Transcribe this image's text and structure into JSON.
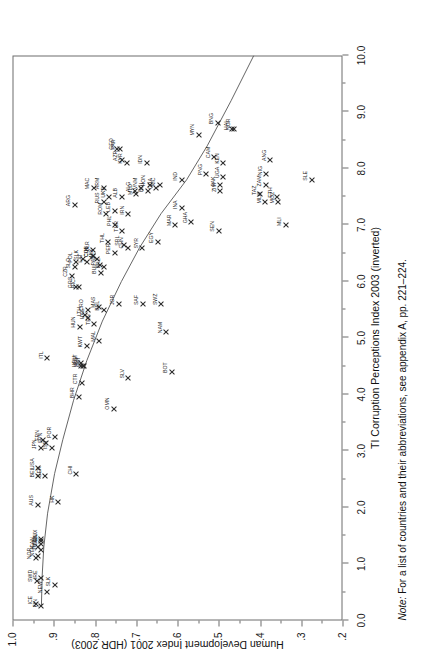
{
  "figure": {
    "note_prefix": "Note:",
    "note_text": " For a list of countries and their abbreviations, see appendix A, pp. 221–224."
  },
  "chart_data": {
    "type": "scatter",
    "title": "",
    "xlabel": "TI Corruption Perceptions Index 2003 (inverted)",
    "ylabel": "Human Development Index 2001 (HDR 2003)",
    "xlim": [
      0.0,
      10.0
    ],
    "ylim": [
      0.2,
      1.0
    ],
    "y_inverted": true,
    "grid": false,
    "legend": null,
    "xticks": [
      "0.0",
      "1.0",
      "2.0",
      "3.0",
      "4.0",
      "5.0",
      "6.0",
      "7.0",
      "8.0",
      "9.0",
      "10.0"
    ],
    "xtick_values": [
      0.0,
      1.0,
      2.0,
      3.0,
      4.0,
      5.0,
      6.0,
      7.0,
      8.0,
      9.0,
      10.0
    ],
    "yticks": [
      "1.0",
      ".9",
      ".8",
      ".7",
      ".6",
      ".5",
      ".4",
      ".3",
      ".2"
    ],
    "ytick_values": [
      1.0,
      0.9,
      0.8,
      0.7,
      0.6,
      0.5,
      0.4,
      0.3,
      0.2
    ],
    "marker": "x",
    "fit_line": {
      "present": true,
      "style": "solid",
      "points": [
        [
          0.25,
          0.93
        ],
        [
          0.8,
          0.928
        ],
        [
          1.3,
          0.924
        ],
        [
          1.9,
          0.915
        ],
        [
          2.6,
          0.898
        ],
        [
          3.2,
          0.878
        ],
        [
          3.9,
          0.852
        ],
        [
          4.6,
          0.82
        ],
        [
          5.3,
          0.782
        ],
        [
          6.0,
          0.736
        ],
        [
          6.6,
          0.692
        ],
        [
          7.2,
          0.64
        ],
        [
          7.8,
          0.578
        ],
        [
          8.4,
          0.528
        ],
        [
          9.2,
          0.47
        ],
        [
          10.0,
          0.415
        ]
      ]
    },
    "points": [
      {
        "label": "ICE",
        "x": 0.3,
        "y": 0.942
      },
      {
        "label": "FIN",
        "x": 0.25,
        "y": 0.93
      },
      {
        "label": "SWD",
        "x": 0.7,
        "y": 0.941
      },
      {
        "label": "NEW",
        "x": 0.5,
        "y": 0.917
      },
      {
        "label": "IRE",
        "x": 0.75,
        "y": 0.93
      },
      {
        "label": "SLK",
        "x": 0.62,
        "y": 0.898
      },
      {
        "label": "NOR",
        "x": 1.1,
        "y": 0.944
      },
      {
        "label": "NTH",
        "x": 1.15,
        "y": 0.938
      },
      {
        "label": "CAN",
        "x": 1.3,
        "y": 0.937
      },
      {
        "label": "DEN",
        "x": 1.35,
        "y": 0.93
      },
      {
        "label": "UK",
        "x": 1.4,
        "y": 0.93
      },
      {
        "label": "SWZ",
        "x": 1.25,
        "y": 0.932
      },
      {
        "label": "LUX",
        "x": 1.45,
        "y": 0.93
      },
      {
        "label": "AUS",
        "x": 2.05,
        "y": 0.939
      },
      {
        "label": "HK",
        "x": 2.1,
        "y": 0.889
      },
      {
        "label": "BEL",
        "x": 2.55,
        "y": 0.937
      },
      {
        "label": "USA",
        "x": 2.7,
        "y": 0.937
      },
      {
        "label": "GER",
        "x": 2.55,
        "y": 0.921
      },
      {
        "label": "CHI",
        "x": 2.6,
        "y": 0.846
      },
      {
        "label": "JPN",
        "x": 3.05,
        "y": 0.932
      },
      {
        "label": "FRN",
        "x": 3.2,
        "y": 0.925
      },
      {
        "label": "ISR",
        "x": 3.05,
        "y": 0.905
      },
      {
        "label": "SPN",
        "x": 3.15,
        "y": 0.918
      },
      {
        "label": "POR",
        "x": 3.25,
        "y": 0.896
      },
      {
        "label": "OMN",
        "x": 3.75,
        "y": 0.755
      },
      {
        "label": "BHR",
        "x": 3.95,
        "y": 0.839
      },
      {
        "label": "CTR",
        "x": 4.2,
        "y": 0.832
      },
      {
        "label": "SLV",
        "x": 4.3,
        "y": 0.72
      },
      {
        "label": "BOT",
        "x": 4.4,
        "y": 0.614
      },
      {
        "label": "EST",
        "x": 4.55,
        "y": 0.833
      },
      {
        "label": "SLU",
        "x": 4.5,
        "y": 0.83
      },
      {
        "label": "ITL",
        "x": 4.65,
        "y": 0.916
      },
      {
        "label": "QAT",
        "x": 4.5,
        "y": 0.826
      },
      {
        "label": "URU",
        "x": 4.5,
        "y": 0.834
      },
      {
        "label": "KWT",
        "x": 4.85,
        "y": 0.82
      },
      {
        "label": "MAL",
        "x": 4.95,
        "y": 0.79
      },
      {
        "label": "NAM",
        "x": 5.1,
        "y": 0.627
      },
      {
        "label": "HUN",
        "x": 5.2,
        "y": 0.837
      },
      {
        "label": "TRN",
        "x": 5.25,
        "y": 0.802
      },
      {
        "label": "LTH",
        "x": 5.4,
        "y": 0.824
      },
      {
        "label": "UAE",
        "x": 5.35,
        "y": 0.816
      },
      {
        "label": "BEL",
        "x": 5.5,
        "y": 0.779
      },
      {
        "label": "CRO",
        "x": 5.5,
        "y": 0.818
      },
      {
        "label": "MAS",
        "x": 5.55,
        "y": 0.79
      },
      {
        "label": "JOR",
        "x": 5.6,
        "y": 0.743
      },
      {
        "label": "SAF",
        "x": 5.6,
        "y": 0.684
      },
      {
        "label": "SWZ2",
        "x": 5.6,
        "y": 0.639
      },
      {
        "label": "GRC",
        "x": 5.9,
        "y": 0.846
      },
      {
        "label": "RIC",
        "x": 5.9,
        "y": 0.838
      },
      {
        "label": "BUL",
        "x": 6.15,
        "y": 0.786
      },
      {
        "label": "CZR",
        "x": 6.1,
        "y": 0.856
      },
      {
        "label": "SLO",
        "x": 6.25,
        "y": 0.849
      },
      {
        "label": "BRZ",
        "x": 6.25,
        "y": 0.777
      },
      {
        "label": "POL",
        "x": 6.35,
        "y": 0.845
      },
      {
        "label": "LAT",
        "x": 6.35,
        "y": 0.82
      },
      {
        "label": "PAN",
        "x": 6.3,
        "y": 0.789
      },
      {
        "label": "COL",
        "x": 6.45,
        "y": 0.806
      },
      {
        "label": "SLK",
        "x": 6.4,
        "y": 0.83
      },
      {
        "label": "MEX",
        "x": 6.4,
        "y": 0.795
      },
      {
        "label": "CUB",
        "x": 6.45,
        "y": 0.805
      },
      {
        "label": "PER",
        "x": 6.5,
        "y": 0.752
      },
      {
        "label": "CHN",
        "x": 6.6,
        "y": 0.721
      },
      {
        "label": "SRL",
        "x": 6.65,
        "y": 0.73
      },
      {
        "label": "BLR",
        "x": 6.55,
        "y": 0.804
      },
      {
        "label": "SYR",
        "x": 6.6,
        "y": 0.685
      },
      {
        "label": "THL",
        "x": 6.7,
        "y": 0.768
      },
      {
        "label": "EGY",
        "x": 6.7,
        "y": 0.648
      },
      {
        "label": "TUR",
        "x": 6.9,
        "y": 0.734
      },
      {
        "label": "MAR",
        "x": 7.0,
        "y": 0.606
      },
      {
        "label": "PHL",
        "x": 7.0,
        "y": 0.751
      },
      {
        "label": "GHA",
        "x": 7.05,
        "y": 0.567
      },
      {
        "label": "IRN",
        "x": 7.2,
        "y": 0.719
      },
      {
        "label": "ROM",
        "x": 7.2,
        "y": 0.773
      },
      {
        "label": "LEB",
        "x": 7.25,
        "y": 0.752
      },
      {
        "label": "INA",
        "x": 7.3,
        "y": 0.59
      },
      {
        "label": "SEN",
        "x": 6.9,
        "y": 0.5
      },
      {
        "label": "MLI",
        "x": 7.0,
        "y": 0.337
      },
      {
        "label": "ARG",
        "x": 7.35,
        "y": 0.849
      },
      {
        "label": "RUS",
        "x": 7.4,
        "y": 0.779
      },
      {
        "label": "MAC",
        "x": 7.65,
        "y": 0.803
      },
      {
        "label": "UKR",
        "x": 7.5,
        "y": 0.766
      },
      {
        "label": "ALB",
        "x": 7.5,
        "y": 0.735
      },
      {
        "label": "MLD",
        "x": 7.55,
        "y": 0.7
      },
      {
        "label": "ARM",
        "x": 7.65,
        "y": 0.779
      },
      {
        "label": "BOL",
        "x": 7.6,
        "y": 0.672
      },
      {
        "label": "ALG",
        "x": 7.6,
        "y": 0.704
      },
      {
        "label": "VNM",
        "x": 7.65,
        "y": 0.688
      },
      {
        "label": "NIC",
        "x": 7.7,
        "y": 0.643
      },
      {
        "label": "GUA",
        "x": 7.65,
        "y": 0.652
      },
      {
        "label": "HON",
        "x": 7.7,
        "y": 0.667
      },
      {
        "label": "IND",
        "x": 7.8,
        "y": 0.59
      },
      {
        "label": "UGA",
        "x": 7.85,
        "y": 0.489
      },
      {
        "label": "ZAM",
        "x": 7.7,
        "y": 0.386
      },
      {
        "label": "TAZ",
        "x": 7.55,
        "y": 0.4
      },
      {
        "label": "MLW",
        "x": 7.4,
        "y": 0.387
      },
      {
        "label": "MOZ",
        "x": 7.4,
        "y": 0.356
      },
      {
        "label": "ETH",
        "x": 7.5,
        "y": 0.359
      },
      {
        "label": "ZIM",
        "x": 7.6,
        "y": 0.496
      },
      {
        "label": "KEN",
        "x": 8.1,
        "y": 0.489
      },
      {
        "label": "CAM",
        "x": 8.2,
        "y": 0.511
      },
      {
        "label": "GEO",
        "x": 8.35,
        "y": 0.746
      },
      {
        "label": "PAR",
        "x": 8.35,
        "y": 0.74
      },
      {
        "label": "AZR",
        "x": 8.15,
        "y": 0.735
      },
      {
        "label": "KYR",
        "x": 8.1,
        "y": 0.723
      },
      {
        "label": "IDN",
        "x": 8.1,
        "y": 0.675
      },
      {
        "label": "PNG",
        "x": 7.9,
        "y": 0.53
      },
      {
        "label": "PAK",
        "x": 7.7,
        "y": 0.498
      },
      {
        "label": "ANG",
        "x": 8.15,
        "y": 0.375
      },
      {
        "label": "NIG",
        "x": 7.9,
        "y": 0.385
      },
      {
        "label": "SLE",
        "x": 7.8,
        "y": 0.275
      },
      {
        "label": "MYN",
        "x": 8.6,
        "y": 0.549
      },
      {
        "label": "HAI",
        "x": 8.7,
        "y": 0.467
      },
      {
        "label": "NGR",
        "x": 8.7,
        "y": 0.463
      },
      {
        "label": "BNG",
        "x": 8.8,
        "y": 0.502
      }
    ]
  }
}
